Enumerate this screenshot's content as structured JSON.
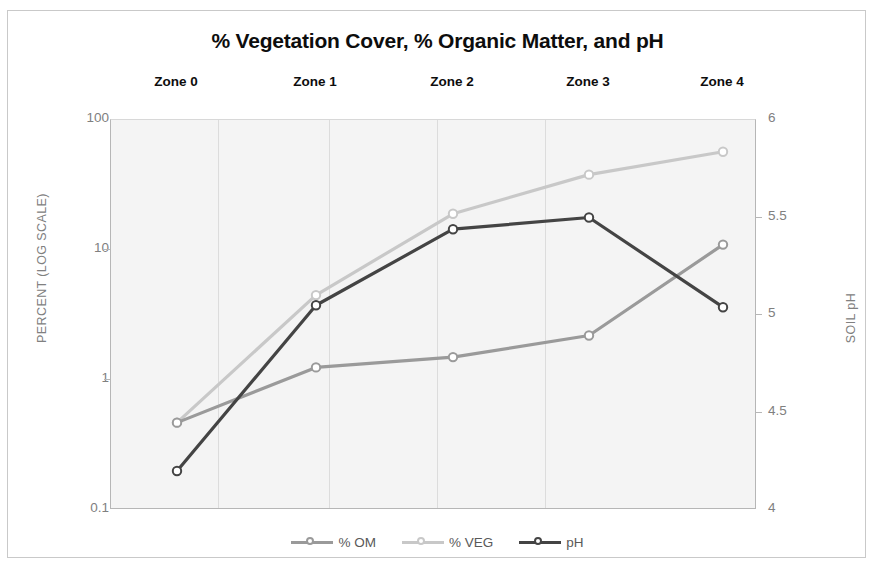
{
  "chart_data": {
    "type": "line",
    "title": "% Vegetation Cover, % Organic Matter, and pH",
    "categories": [
      "Zone 0",
      "Zone 1",
      "Zone 2",
      "Zone 3",
      "Zone 4"
    ],
    "xlabel": "",
    "ylabel": "PERCENT (LOG SCALE)",
    "y2label": "SOIL pH",
    "yscale": "log",
    "ylim": [
      0.1,
      100
    ],
    "y2lim": [
      4,
      6
    ],
    "yticks": [
      "0.1",
      "1",
      "10",
      "100"
    ],
    "y2ticks": [
      "4",
      "4.5",
      "5",
      "5.5",
      "6"
    ],
    "grid": "vertical",
    "legend_position": "bottom",
    "series": [
      {
        "name": "% OM",
        "axis": "left",
        "color": "#9a9a9a",
        "values": [
          0.47,
          1.25,
          1.5,
          2.2,
          11
        ]
      },
      {
        "name": "% VEG",
        "axis": "left",
        "color": "#c8c8c8",
        "values": [
          0.47,
          4.5,
          19,
          38,
          57
        ]
      },
      {
        "name": "pH",
        "axis": "right",
        "color": "#444444",
        "values": [
          4.2,
          5.05,
          5.44,
          5.5,
          5.04
        ]
      }
    ]
  },
  "axes": {
    "left_label": "PERCENT (LOG SCALE)",
    "right_label": "SOIL pH",
    "left_ticks": [
      "100",
      "10",
      "1",
      "0.1"
    ],
    "right_ticks": [
      "6",
      "5.5",
      "5",
      "4.5",
      "4"
    ]
  },
  "zones": [
    "Zone 0",
    "Zone 1",
    "Zone 2",
    "Zone 3",
    "Zone 4"
  ],
  "legend": [
    {
      "label": "% OM",
      "color": "#9a9a9a"
    },
    {
      "label": "% VEG",
      "color": "#c8c8c8"
    },
    {
      "label": "pH",
      "color": "#444444"
    }
  ],
  "colors": {
    "om": "#9a9a9a",
    "veg": "#c8c8c8",
    "ph": "#444444",
    "plot_bg": "#f4f4f4",
    "axis": "#b6b6b6",
    "tick_text": "#808080"
  }
}
